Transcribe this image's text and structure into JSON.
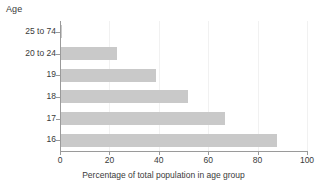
{
  "chart_data": {
    "type": "bar",
    "orientation": "horizontal",
    "title": "",
    "ylabel": "Age",
    "xlabel": "Percentage of total population in age group",
    "categories": [
      "25 to 74",
      "20 to 24",
      "19",
      "18",
      "17",
      "16"
    ],
    "values": [
      1,
      23,
      39,
      52,
      67,
      88
    ],
    "xlim": [
      0,
      100
    ],
    "xticks": [
      0,
      20,
      40,
      60,
      80,
      100
    ],
    "xtick_labels": [
      "0",
      "20",
      "40",
      "60",
      "80",
      "100"
    ],
    "grid": "vertical",
    "legend": "none",
    "bar_color": "#c9c9c9",
    "axis_color": "#9a9a9a",
    "gridline_color": "#f1f1f1",
    "text_color": "#3a3a3a"
  }
}
